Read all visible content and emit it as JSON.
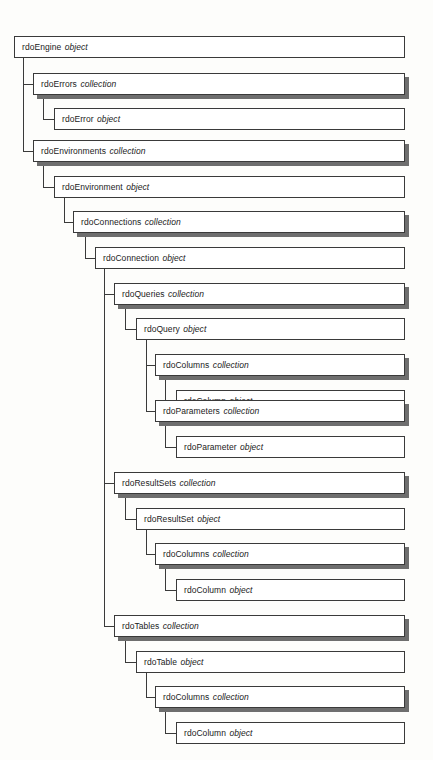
{
  "diagram": {
    "background_color": "#fdfdfb",
    "box_fill_color": "#ffffff",
    "box_border_color": "#3a3a3a",
    "shadow_color": "#6e6e6e",
    "text_color": "#1b1b1b"
  },
  "nodes": [
    {
      "id": "rdoEngine",
      "name": "rdoEngine",
      "kind": "object",
      "level": 0,
      "x": 14,
      "y": 36,
      "width": 391,
      "shadow": false
    },
    {
      "id": "rdoErrors",
      "name": "rdoErrors",
      "kind": "collection",
      "level": 1,
      "x": 33,
      "y": 73,
      "width": 372,
      "shadow": true
    },
    {
      "id": "rdoError",
      "name": "rdoError",
      "kind": "object",
      "level": 2,
      "x": 54,
      "y": 108,
      "width": 351,
      "shadow": false
    },
    {
      "id": "rdoEnvironments",
      "name": "rdoEnvironments",
      "kind": "collection",
      "level": 1,
      "x": 33,
      "y": 140,
      "width": 372,
      "shadow": true
    },
    {
      "id": "rdoEnvironment",
      "name": "rdoEnvironment",
      "kind": "object",
      "level": 2,
      "x": 54,
      "y": 176,
      "width": 351,
      "shadow": false
    },
    {
      "id": "rdoConnections",
      "name": "rdoConnections",
      "kind": "collection",
      "level": 3,
      "x": 73,
      "y": 211,
      "width": 332,
      "shadow": true
    },
    {
      "id": "rdoConnection",
      "name": "rdoConnection",
      "kind": "object",
      "level": 4,
      "x": 95,
      "y": 247,
      "width": 310,
      "shadow": false
    },
    {
      "id": "rdoQueries",
      "name": "rdoQueries",
      "kind": "collection",
      "level": 5,
      "x": 114,
      "y": 283,
      "width": 291,
      "shadow": true
    },
    {
      "id": "rdoQuery",
      "name": "rdoQuery",
      "kind": "object",
      "level": 6,
      "x": 136,
      "y": 318,
      "width": 269,
      "shadow": false
    },
    {
      "id": "rdoQuery-rdoColumns",
      "name": "rdoColumns",
      "kind": "collection",
      "level": 7,
      "x": 155,
      "y": 354,
      "width": 250,
      "shadow": true
    },
    {
      "id": "rdoQuery-rdoColumn",
      "name": "rdoColumn",
      "kind": "object",
      "level": 8,
      "x": 176,
      "y": 390,
      "width": 229,
      "shadow": false
    },
    {
      "id": "rdoParameters",
      "name": "rdoParameters",
      "kind": "collection",
      "level": 7,
      "x": 155,
      "y": 400,
      "width": 250,
      "shadow": true
    },
    {
      "id": "rdoParameter",
      "name": "rdoParameter",
      "kind": "object",
      "level": 8,
      "x": 176,
      "y": 436,
      "width": 229,
      "shadow": false
    },
    {
      "id": "rdoResultSets",
      "name": "rdoResultSets",
      "kind": "collection",
      "level": 5,
      "x": 114,
      "y": 472,
      "width": 291,
      "shadow": true
    },
    {
      "id": "rdoResultSet",
      "name": "rdoResultSet",
      "kind": "object",
      "level": 6,
      "x": 136,
      "y": 508,
      "width": 269,
      "shadow": false
    },
    {
      "id": "rdoResultSet-rdoColumns",
      "name": "rdoColumns",
      "kind": "collection",
      "level": 7,
      "x": 155,
      "y": 543,
      "width": 250,
      "shadow": true
    },
    {
      "id": "rdoResultSet-rdoColumn",
      "name": "rdoColumn",
      "kind": "object",
      "level": 8,
      "x": 176,
      "y": 579,
      "width": 229,
      "shadow": false
    },
    {
      "id": "rdoTables",
      "name": "rdoTables",
      "kind": "collection",
      "level": 5,
      "x": 114,
      "y": 615,
      "width": 291,
      "shadow": true
    },
    {
      "id": "rdoTable",
      "name": "rdoTable",
      "kind": "object",
      "level": 6,
      "x": 136,
      "y": 651,
      "width": 269,
      "shadow": false
    },
    {
      "id": "rdoTable-rdoColumns",
      "name": "rdoColumns",
      "kind": "collection",
      "level": 7,
      "x": 155,
      "y": 686,
      "width": 250,
      "shadow": true
    },
    {
      "id": "rdoTable-rdoColumn",
      "name": "rdoColumn",
      "kind": "object",
      "level": 8,
      "x": 176,
      "y": 722,
      "width": 229,
      "shadow": false
    }
  ],
  "connectors": {
    "vertical": [
      {
        "id": "trunk-rdoEngine",
        "x": 23,
        "y": 58,
        "height": 93
      },
      {
        "id": "trunk-rdoErrors",
        "x": 43,
        "y": 95,
        "height": 24
      },
      {
        "id": "trunk-rdoEnvironments",
        "x": 43,
        "y": 162,
        "height": 25
      },
      {
        "id": "trunk-rdoEnvironment",
        "x": 64,
        "y": 198,
        "height": 24
      },
      {
        "id": "trunk-rdoConnections",
        "x": 85,
        "y": 233,
        "height": 25
      },
      {
        "id": "trunk-rdoConnection",
        "x": 104,
        "y": 269,
        "height": 357
      },
      {
        "id": "trunk-rdoQueries",
        "x": 125,
        "y": 305,
        "height": 24
      },
      {
        "id": "trunk-rdoQuery",
        "x": 146,
        "y": 340,
        "height": 71
      },
      {
        "id": "trunk-rdoQuery-rdoColumns",
        "x": 165,
        "y": 376,
        "height": 25
      },
      {
        "id": "trunk-rdoParameters",
        "x": 165,
        "y": 422,
        "height": 25
      },
      {
        "id": "trunk-rdoResultSets",
        "x": 125,
        "y": 494,
        "height": 25
      },
      {
        "id": "trunk-rdoResultSet",
        "x": 146,
        "y": 530,
        "height": 24
      },
      {
        "id": "trunk-rdoResultSet-rdoColumns",
        "x": 165,
        "y": 565,
        "height": 25
      },
      {
        "id": "trunk-rdoTables",
        "x": 125,
        "y": 637,
        "height": 25
      },
      {
        "id": "trunk-rdoTable",
        "x": 146,
        "y": 673,
        "height": 24
      },
      {
        "id": "trunk-rdoTable-rdoColumns",
        "x": 165,
        "y": 708,
        "height": 25
      }
    ],
    "horizontal": [
      {
        "id": "link-rdoErrors",
        "x": 23,
        "y": 84,
        "width": 11
      },
      {
        "id": "link-rdoError",
        "x": 43,
        "y": 119,
        "width": 12
      },
      {
        "id": "link-rdoEnvironments",
        "x": 23,
        "y": 151,
        "width": 11
      },
      {
        "id": "link-rdoEnvironment",
        "x": 43,
        "y": 187,
        "width": 12
      },
      {
        "id": "link-rdoConnections",
        "x": 64,
        "y": 222,
        "width": 10
      },
      {
        "id": "link-rdoConnection",
        "x": 85,
        "y": 258,
        "width": 11
      },
      {
        "id": "link-rdoQueries",
        "x": 104,
        "y": 294,
        "width": 11
      },
      {
        "id": "link-rdoQuery",
        "x": 125,
        "y": 329,
        "width": 12
      },
      {
        "id": "link-rdoQuery-rdoColumns",
        "x": 146,
        "y": 365,
        "width": 10
      },
      {
        "id": "link-rdoQuery-rdoColumn",
        "x": 165,
        "y": 401,
        "width": 12
      },
      {
        "id": "link-rdoParameters",
        "x": 146,
        "y": 411,
        "width": 10
      },
      {
        "id": "link-rdoParameter",
        "x": 165,
        "y": 447,
        "width": 12
      },
      {
        "id": "link-rdoResultSets",
        "x": 104,
        "y": 483,
        "width": 11
      },
      {
        "id": "link-rdoResultSet",
        "x": 125,
        "y": 519,
        "width": 12
      },
      {
        "id": "link-rdoResultSet-rdoColumns",
        "x": 146,
        "y": 554,
        "width": 10
      },
      {
        "id": "link-rdoResultSet-rdoColumn",
        "x": 165,
        "y": 590,
        "width": 12
      },
      {
        "id": "link-rdoTables",
        "x": 104,
        "y": 626,
        "width": 11
      },
      {
        "id": "link-rdoTable",
        "x": 125,
        "y": 662,
        "width": 12
      },
      {
        "id": "link-rdoTable-rdoColumns",
        "x": 146,
        "y": 697,
        "width": 10
      },
      {
        "id": "link-rdoTable-rdoColumn",
        "x": 165,
        "y": 733,
        "width": 12
      }
    ]
  }
}
